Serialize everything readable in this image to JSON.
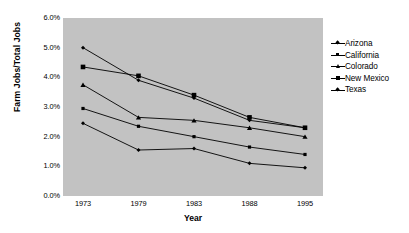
{
  "chart_data": {
    "type": "line",
    "title": "",
    "xlabel": "Year",
    "ylabel": "Farm Jobs/Total Jobs",
    "categories": [
      "1973",
      "1979",
      "1983",
      "1988",
      "1995"
    ],
    "x_tick_labels": [
      "1973",
      "1979",
      "1983",
      "1988",
      "1995"
    ],
    "y_tick_labels": [
      "0.0%",
      "1.0%",
      "2.0%",
      "3.0%",
      "4.0%",
      "5.0%",
      "6.0%"
    ],
    "y_tick_values": [
      0.0,
      1.0,
      2.0,
      3.0,
      4.0,
      5.0,
      6.0
    ],
    "ylim": [
      0.0,
      6.0
    ],
    "grid": false,
    "legend_position": "right",
    "plot_background": "#c2c2c2",
    "page_background": "#ffffff",
    "line_color": "#000000",
    "series": [
      {
        "name": "Arizona",
        "marker": "diamond",
        "values": [
          5.0,
          3.9,
          3.3,
          2.55,
          2.3
        ]
      },
      {
        "name": "California",
        "marker": "square",
        "values": [
          2.95,
          2.35,
          2.0,
          1.65,
          1.4
        ]
      },
      {
        "name": "Colorado",
        "marker": "triangle",
        "values": [
          3.75,
          2.65,
          2.55,
          2.3,
          2.0
        ]
      },
      {
        "name": "New Mexico",
        "marker": "square-lg",
        "values": [
          4.35,
          4.05,
          3.4,
          2.65,
          2.3
        ]
      },
      {
        "name": "Texas",
        "marker": "diamond",
        "values": [
          2.45,
          1.55,
          1.6,
          1.1,
          0.95
        ]
      }
    ]
  }
}
